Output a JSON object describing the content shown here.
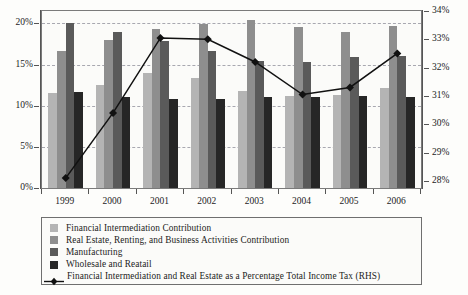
{
  "chart_data": {
    "type": "bar",
    "title": "",
    "subtitle": "",
    "xlabel": "",
    "ylabel": "",
    "grid": true,
    "legend_position": "bottom",
    "categories": [
      "1999",
      "2000",
      "2001",
      "2002",
      "2003",
      "2004",
      "2005",
      "2006"
    ],
    "left_axis": {
      "label": "",
      "ylim": [
        0,
        21.5
      ],
      "ticks": [
        0,
        5,
        10,
        15,
        20
      ],
      "tick_labels": [
        "0%",
        "5%",
        "10%",
        "15%",
        "20%"
      ],
      "unit": "%"
    },
    "right_axis": {
      "label": "RHS",
      "ylim": [
        27.75,
        34.0
      ],
      "ticks": [
        28,
        29,
        30,
        31,
        32,
        33,
        34
      ],
      "tick_labels": [
        "28%",
        "29%",
        "30%",
        "31%",
        "32%",
        "33%",
        "34%"
      ],
      "unit": "%"
    },
    "series": [
      {
        "name": "Financial Intermediation Contribution",
        "type": "bar",
        "axis": "left",
        "color": "#b4b4b4",
        "values": [
          11.5,
          12.5,
          14.0,
          13.4,
          11.8,
          11.2,
          11.3,
          12.2
        ]
      },
      {
        "name": "Real Estate, Renting, and Business Activities Contribution",
        "type": "bar",
        "axis": "left",
        "color": "#8e8e8e",
        "values": [
          16.7,
          18.0,
          19.3,
          19.9,
          20.4,
          19.5,
          18.9,
          19.7
        ]
      },
      {
        "name": "Manufacturing",
        "type": "bar",
        "axis": "left",
        "color": "#5a5a5a",
        "values": [
          20.0,
          19.0,
          17.9,
          16.7,
          15.4,
          15.3,
          15.9,
          16.0
        ]
      },
      {
        "name": "Wholesale and Reatail",
        "type": "bar",
        "axis": "left",
        "color": "#262626",
        "values": [
          11.7,
          11.1,
          10.8,
          10.8,
          11.1,
          11.1,
          11.2,
          11.0
        ]
      },
      {
        "name": "Financial Intermediation and Real Estate as a Percentage Total Income Tax (RHS)",
        "type": "line",
        "axis": "right",
        "color": "#111111",
        "marker": "diamond",
        "values": [
          28.1,
          30.4,
          33.05,
          33.0,
          32.2,
          31.05,
          31.3,
          32.5
        ]
      }
    ]
  },
  "legend": {
    "entries": [
      {
        "label": "Financial Intermediation Contribution",
        "swatch": "light-gray-swatch"
      },
      {
        "label": "Real Estate, Renting, and Business Activities Contribution",
        "swatch": "medium-gray-swatch"
      },
      {
        "label": "Manufacturing",
        "swatch": "dark-gray-swatch"
      },
      {
        "label": "Wholesale and Reatail",
        "swatch": "black-swatch"
      },
      {
        "label": "Financial Intermediation and Real Estate as a Percentage Total Income Tax (RHS)",
        "swatch": "line-diamond-marker"
      }
    ]
  }
}
